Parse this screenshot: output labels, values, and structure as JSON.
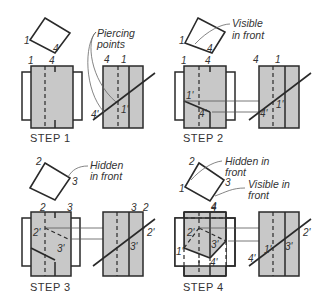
{
  "figure": {
    "panels": [
      {
        "id": "step1",
        "caption": "STEP 1",
        "note": [
          "Piercing",
          "points"
        ],
        "top_labels": {
          "a": "1",
          "b": "4"
        },
        "front_top": {
          "a": "1",
          "b": "4"
        },
        "side_top": {
          "a": "4",
          "b": "1"
        },
        "side_points": {
          "p1": "1'",
          "p4": "4'"
        }
      },
      {
        "id": "step2",
        "caption": "STEP 2",
        "note": [
          "Visible",
          "in front"
        ],
        "top_labels": {
          "a": "1",
          "b": "4"
        },
        "front_top": {
          "a": "1",
          "b": "4"
        },
        "side_top": {
          "a": "4",
          "b": "1"
        },
        "front_points": {
          "p1": "1'",
          "p4": "4'"
        },
        "side_points": {
          "p1": "1'",
          "p4": "4'"
        }
      },
      {
        "id": "step3",
        "caption": "STEP 3",
        "note": [
          "Hidden",
          "in front"
        ],
        "top_labels": {
          "a": "2",
          "b": "3"
        },
        "front_top": {
          "a": "2",
          "b": "3"
        },
        "side_top": {
          "a": "3",
          "b": "2"
        },
        "front_points": {
          "p2": "2'",
          "p3": "3'"
        },
        "side_points": {
          "p2": "2'",
          "p3": "3'"
        }
      },
      {
        "id": "step4",
        "caption": "STEP 4",
        "note_hidden": [
          "Hidden in",
          "front"
        ],
        "note_visible": [
          "Visible in",
          "front"
        ],
        "top_labels": {
          "a": "2",
          "b": "3",
          "c": "1",
          "d": "4"
        },
        "front_top": {
          "a": "4"
        },
        "front_points": {
          "p1": "1'",
          "p2": "2'",
          "p3": "3'",
          "p4": "4'"
        },
        "side_points": {
          "p1": "1'",
          "p2": "2'",
          "p3": "3'",
          "p4": "4'"
        }
      }
    ]
  },
  "colors": {
    "line": "#2a2a2a",
    "fill": "#c8c8c8",
    "thin": "#555555"
  }
}
